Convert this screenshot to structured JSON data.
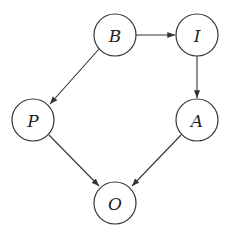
{
  "diagram": {
    "type": "directed-graph",
    "nodes": [
      {
        "id": "B",
        "label": "B",
        "x": 115,
        "y": 35
      },
      {
        "id": "I",
        "label": "I",
        "x": 197,
        "y": 35
      },
      {
        "id": "P",
        "label": "P",
        "x": 33,
        "y": 120
      },
      {
        "id": "A",
        "label": "A",
        "x": 197,
        "y": 120
      },
      {
        "id": "O",
        "label": "O",
        "x": 115,
        "y": 203
      }
    ],
    "edges": [
      {
        "from": "B",
        "to": "I"
      },
      {
        "from": "B",
        "to": "P"
      },
      {
        "from": "I",
        "to": "A"
      },
      {
        "from": "P",
        "to": "O"
      },
      {
        "from": "A",
        "to": "O"
      }
    ],
    "node_radius": 21,
    "colors": {
      "stroke": "#333333",
      "fill": "#ffffff"
    }
  }
}
